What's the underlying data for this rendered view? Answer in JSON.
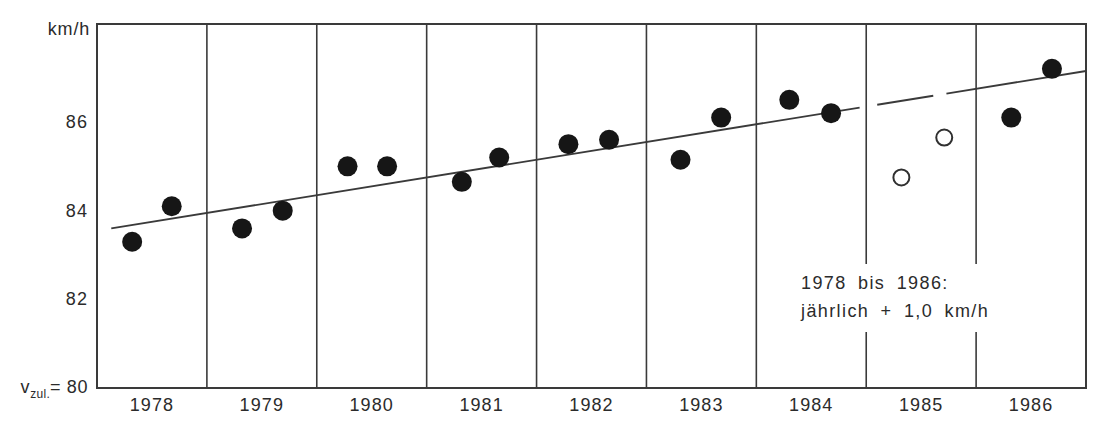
{
  "y_axis": {
    "unit": "km/h",
    "ticks": [
      86,
      84,
      82
    ],
    "baseline": {
      "prefix": "v",
      "subscript": "zul.",
      "equals": "=",
      "value": "80"
    }
  },
  "x_axis": {
    "years": [
      "1978",
      "1979",
      "1980",
      "1981",
      "1982",
      "1983",
      "1984",
      "1985",
      "1986"
    ]
  },
  "annotation": {
    "line1": "1978 bis 1986:",
    "line2": "jährlich + 1,0 km/h"
  },
  "colors": {
    "line_ink": "#3a3a3a",
    "point_ink": "#161616",
    "background": "#ffffff"
  },
  "chart_data": {
    "type": "scatter",
    "title": "",
    "ylabel": "km/h",
    "xlabel": "",
    "x_categories": [
      "1978",
      "1979",
      "1980",
      "1981",
      "1982",
      "1983",
      "1984",
      "1985",
      "1986"
    ],
    "y_tick_values": [
      80,
      82,
      84,
      86
    ],
    "x_range_years": [
      1978,
      1987
    ],
    "y_range": [
      80,
      88.2
    ],
    "grid": "vertical-year-boundaries",
    "series": [
      {
        "name": "filled-circles",
        "marker": "filled-circle",
        "points": [
          {
            "year": 1978.32,
            "kmh": 83.3
          },
          {
            "year": 1978.68,
            "kmh": 84.1
          },
          {
            "year": 1979.32,
            "kmh": 83.6
          },
          {
            "year": 1979.69,
            "kmh": 84.0
          },
          {
            "year": 1980.28,
            "kmh": 85.0
          },
          {
            "year": 1980.64,
            "kmh": 85.0
          },
          {
            "year": 1981.32,
            "kmh": 84.65
          },
          {
            "year": 1981.66,
            "kmh": 85.2
          },
          {
            "year": 1982.29,
            "kmh": 85.5
          },
          {
            "year": 1982.66,
            "kmh": 85.6
          },
          {
            "year": 1983.31,
            "kmh": 85.15
          },
          {
            "year": 1983.68,
            "kmh": 86.1
          },
          {
            "year": 1984.3,
            "kmh": 86.5
          },
          {
            "year": 1984.68,
            "kmh": 86.2
          },
          {
            "year": 1986.32,
            "kmh": 86.1
          },
          {
            "year": 1986.69,
            "kmh": 87.2
          }
        ]
      },
      {
        "name": "open-circles",
        "marker": "open-circle",
        "points": [
          {
            "year": 1985.32,
            "kmh": 84.75
          },
          {
            "year": 1985.71,
            "kmh": 85.65
          }
        ]
      }
    ],
    "trend_line": {
      "start": {
        "year": 1978.13,
        "value": 83.6
      },
      "end": {
        "year": 1987.0,
        "value": 87.15
      },
      "style_segments": [
        {
          "from": 1978.13,
          "to": 1984.94,
          "style": "solid"
        },
        {
          "from": 1985.1,
          "to": 1985.61,
          "style": "dash"
        },
        {
          "from": 1985.73,
          "to": 1987.0,
          "style": "solid"
        }
      ],
      "annotation": "1978 bis 1986: jährlich + 1,0 km/h"
    }
  }
}
